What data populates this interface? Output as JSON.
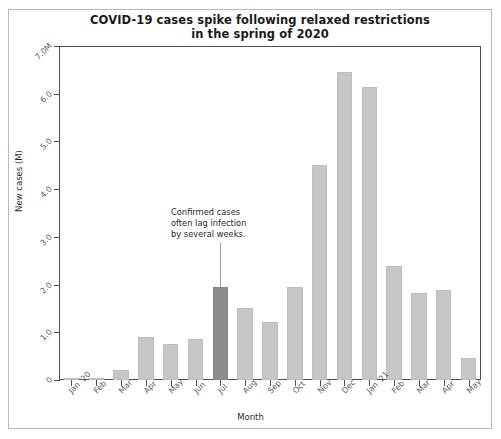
{
  "chart_data": {
    "type": "bar",
    "title": "COVID-19 cases spike following relaxed restrictions in the spring of 2020",
    "title_line1": "COVID-19 cases spike following relaxed restrictions",
    "title_line2": "in the spring of 2020",
    "xlabel": "Month",
    "ylabel": "New cases (M)",
    "ylim": [
      0,
      7.0
    ],
    "grid": false,
    "legend": null,
    "categories": [
      "Jan '20",
      "Feb",
      "Mar",
      "Apr",
      "May",
      "Jun",
      "Jul",
      "Aug",
      "Sep",
      "Oct",
      "Nov",
      "Dec",
      "Jan '21",
      "Feb",
      "Mar",
      "Apr",
      "May"
    ],
    "values": [
      0.01,
      0.02,
      0.2,
      0.9,
      0.75,
      0.87,
      1.95,
      1.5,
      1.22,
      1.95,
      4.5,
      6.45,
      6.15,
      2.4,
      1.82,
      1.88,
      0.47
    ],
    "highlight_index": 6,
    "ytick_labels": [
      "0",
      "1.0",
      "2.0",
      "3.0",
      "4.0",
      "5.0",
      "6.0",
      "7.0M"
    ],
    "ytick_values": [
      0,
      1.0,
      2.0,
      3.0,
      4.0,
      5.0,
      6.0,
      7.0
    ],
    "annotations": [
      {
        "text": "Confirmed cases often lag infection by several weeks.",
        "line1": "Confirmed cases",
        "line2": "often lag infection",
        "line3": "by several weeks.",
        "target_category": "Jul"
      }
    ],
    "colors": {
      "bar": "#c6c6c6",
      "bar_highlight": "#8c8c8c",
      "axis": "#4f4f4f",
      "text": "#1f1f1f",
      "tick_label": "#5a5a5a",
      "background": "#ffffff",
      "figure_border": "#b9b9b9"
    }
  }
}
